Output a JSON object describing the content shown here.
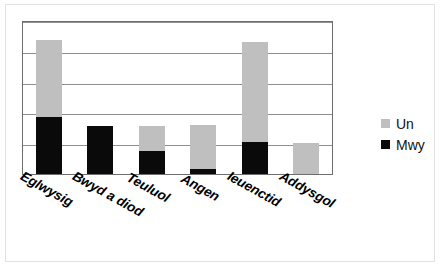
{
  "chart_data": {
    "type": "bar",
    "stacked": true,
    "title": "",
    "subtitle": "",
    "xlabel": "",
    "ylabel": "",
    "categories": [
      "Eglwysig",
      "Bwyd a diod",
      "Teuluol",
      "Angen",
      "Ieuenctid",
      "Addysgol"
    ],
    "series": [
      {
        "name": "Mwy",
        "color": "#0a0a0a",
        "values": [
          1.85,
          1.55,
          0.75,
          0.15,
          1.05,
          0.0
        ]
      },
      {
        "name": "Un",
        "color": "#bfbfbf",
        "values": [
          2.5,
          0.0,
          0.8,
          1.45,
          3.25,
          1.0
        ]
      }
    ],
    "totals": [
      4.35,
      1.55,
      1.55,
      1.6,
      4.3,
      1.0
    ],
    "ylim": [
      0,
      5
    ],
    "yticks": [
      0,
      1,
      2,
      3,
      4,
      5
    ],
    "ytick_labels": [
      "",
      "",
      "",
      "",
      "",
      ""
    ],
    "grid": true,
    "grid_axis": "y",
    "legend_position": "right",
    "stack_order": [
      "Mwy",
      "Un"
    ]
  },
  "legend": {
    "items": [
      {
        "label": "Un",
        "color": "#bfbyf"
      },
      {
        "label": "Mwy",
        "color": "#0a0a0a"
      }
    ],
    "un_label": "Un",
    "mwy_label": "Mwy"
  },
  "colors": {
    "series_un": "#bfbfbf",
    "series_mwy": "#0a0a0a",
    "gridline": "#8f8f8f",
    "axis_frame": "#6e6e6e",
    "background": "#ffffff",
    "label_text": "#000000"
  }
}
